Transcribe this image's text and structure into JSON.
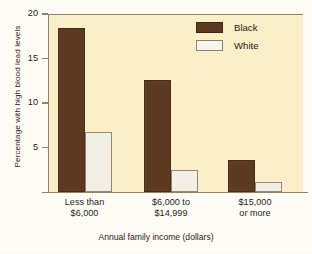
{
  "chart_data": {
    "type": "bar",
    "title": "",
    "xlabel": "Annual family income (dollars)",
    "ylabel": "Percentage with high blood lead levels",
    "categories": [
      "Less than\n$6,000",
      "$6,000 to\n$14,999",
      "$15,000\nor more"
    ],
    "category_lines": [
      [
        "Less than",
        "$6,000"
      ],
      [
        "$6,000 to",
        "$14,999"
      ],
      [
        "$15,000",
        "or more"
      ]
    ],
    "series": [
      {
        "name": "Black",
        "color": "#5C3A22",
        "values": [
          18.4,
          12.6,
          3.6
        ]
      },
      {
        "name": "White",
        "color": "#F2EFE6",
        "values": [
          6.7,
          2.5,
          1.1
        ]
      }
    ],
    "ylim": [
      0,
      20
    ],
    "yticks": [
      5,
      10,
      15,
      20
    ],
    "ytick_labels": [
      "5",
      "10",
      "15",
      "20"
    ],
    "grid": false,
    "legend_position": "top-right"
  },
  "legend": {
    "items": [
      {
        "label": "Black",
        "swatch": "black"
      },
      {
        "label": "White",
        "swatch": "white"
      }
    ]
  },
  "colors": {
    "series_black": "#5C3A22",
    "series_white": "#F2EFE6",
    "plot_background": "#FAEFC8",
    "page_background": "#FEFDF5",
    "axis": "#8F8468",
    "text": "#241D15"
  }
}
